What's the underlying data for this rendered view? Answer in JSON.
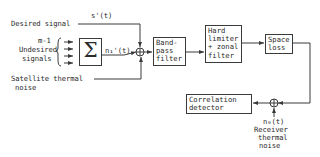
{
  "diagram": {
    "type": "block-diagram",
    "inputs": {
      "desired_signal": "Desired signal",
      "desired_signal_symbol": "s'(t)",
      "undesired_count": "m-1",
      "undesired_label_line1": "Undesired",
      "undesired_label_line2": "signals",
      "satellite_noise_line1": "Satellite thermal",
      "satellite_noise_line2": "noise"
    },
    "summer_symbol": "Σ",
    "interference_symbol": "n₁'(t)",
    "blocks": {
      "bandpass_filter": "Band-\npass\nfilter",
      "hard_limiter": "Hard\nlimiter\n+ zonal\nfilter",
      "space_loss": "Space\nloss",
      "correlation_detector": "Correlation\ndetector"
    },
    "receiver_noise": {
      "symbol": "n₀(t)",
      "line1": "Receiver",
      "line2": "thermal",
      "line3": "noise"
    },
    "line_color": "#3a3a3a"
  }
}
